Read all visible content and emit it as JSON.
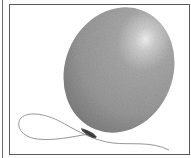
{
  "image": {
    "subject": "balloon",
    "description": "Grayscale illustration of an inflated oval balloon with a tied knot and a loose curling string, inside a rectangular frame",
    "colors": {
      "balloon_base": "#9a9a9a",
      "balloon_dark": "#7c7c7c",
      "highlight": "#f4f4f4",
      "knot": "#3c3c3c",
      "string": "#8a8a8a",
      "frame": "#5a5a5a",
      "background": "#ffffff"
    }
  }
}
